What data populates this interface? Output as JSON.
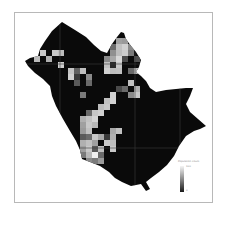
{
  "map": {
    "background": "#ffffff",
    "fill_color": "#0a0a0a",
    "frame_color": "#b8b8b8",
    "grid_line_color": "#3a3a3a",
    "outline": "62,22 75,30 86,37 94,45 101,51 107,53 112,44 117,37 121,32 124,33 126,39 131,46 136,52 141,60 139,67 136,72 141,76 146,81 150,88 156,92 166,90 176,89 186,88 193,88 190,96 186,104 190,112 198,119 206,126 200,129 194,131 186,136 179,146 174,156 167,165 159,172 151,178 146,182 150,189 146,191 141,184 131,186 122,182 115,178 109,172 100,166 90,162 82,159 80,150 76,141 70,131 63,119 56,106 52,96 50,86 43,79 35,73 28,66 25,61 30,58 38,56 40,49 45,41 52,31",
    "grid_lines": {
      "vertical_x": [
        60,
        135,
        180
      ],
      "horizontal_y": [
        64,
        148
      ]
    },
    "cells": [
      {
        "x": 40,
        "y": 50,
        "shade": "#c8c8c8"
      },
      {
        "x": 52,
        "y": 50,
        "shade": "#c8c8c8"
      },
      {
        "x": 58,
        "y": 50,
        "shade": "#bdbdbd"
      },
      {
        "x": 34,
        "y": 56,
        "shade": "#bcbcbc"
      },
      {
        "x": 46,
        "y": 56,
        "shade": "#b0b0b0"
      },
      {
        "x": 58,
        "y": 62,
        "shade": "#cfcfcf"
      },
      {
        "x": 68,
        "y": 68,
        "shade": "#c4c4c4"
      },
      {
        "x": 74,
        "y": 68,
        "shade": "#606060"
      },
      {
        "x": 80,
        "y": 68,
        "shade": "#bebebe"
      },
      {
        "x": 68,
        "y": 74,
        "shade": "#d0d0d0"
      },
      {
        "x": 74,
        "y": 74,
        "shade": "#3a3a3a"
      },
      {
        "x": 86,
        "y": 74,
        "shade": "#8a8a8a"
      },
      {
        "x": 74,
        "y": 80,
        "shade": "#5a5a5a"
      },
      {
        "x": 86,
        "y": 80,
        "shade": "#6a6a6a"
      },
      {
        "x": 80,
        "y": 92,
        "shade": "#7a7a7a"
      },
      {
        "x": 116,
        "y": 38,
        "shade": "#a0a0a0"
      },
      {
        "x": 122,
        "y": 38,
        "shade": "#9a9a9a"
      },
      {
        "x": 110,
        "y": 44,
        "shade": "#6a6a6a"
      },
      {
        "x": 116,
        "y": 44,
        "shade": "#c0c0c0"
      },
      {
        "x": 122,
        "y": 44,
        "shade": "#d0d0d0"
      },
      {
        "x": 128,
        "y": 44,
        "shade": "#8a8a8a"
      },
      {
        "x": 110,
        "y": 50,
        "shade": "#909090"
      },
      {
        "x": 116,
        "y": 50,
        "shade": "#bdbdbd"
      },
      {
        "x": 122,
        "y": 50,
        "shade": "#cccccc"
      },
      {
        "x": 128,
        "y": 50,
        "shade": "#7a7a7a"
      },
      {
        "x": 104,
        "y": 56,
        "shade": "#8a8a8a"
      },
      {
        "x": 110,
        "y": 56,
        "shade": "#a8a8a8"
      },
      {
        "x": 116,
        "y": 56,
        "shade": "#d8d8d8"
      },
      {
        "x": 122,
        "y": 56,
        "shade": "#4a4a4a"
      },
      {
        "x": 134,
        "y": 56,
        "shade": "#505050"
      },
      {
        "x": 104,
        "y": 62,
        "shade": "#c2c2c2"
      },
      {
        "x": 110,
        "y": 62,
        "shade": "#2a2a2a"
      },
      {
        "x": 116,
        "y": 62,
        "shade": "#c8c8c8"
      },
      {
        "x": 128,
        "y": 68,
        "shade": "#6a6a6a"
      },
      {
        "x": 134,
        "y": 68,
        "shade": "#b8b8b8"
      },
      {
        "x": 140,
        "y": 68,
        "shade": "#c8c8c8"
      },
      {
        "x": 104,
        "y": 68,
        "shade": "#d0d0d0"
      },
      {
        "x": 110,
        "y": 68,
        "shade": "#bdbdbd"
      },
      {
        "x": 116,
        "y": 68,
        "shade": "#c0c0c0"
      },
      {
        "x": 128,
        "y": 80,
        "shade": "#c2c2c2"
      },
      {
        "x": 122,
        "y": 86,
        "shade": "#6a6a6a"
      },
      {
        "x": 134,
        "y": 86,
        "shade": "#b0b0b0"
      },
      {
        "x": 116,
        "y": 86,
        "shade": "#4a4a4a"
      },
      {
        "x": 128,
        "y": 92,
        "shade": "#8a8a8a"
      },
      {
        "x": 134,
        "y": 92,
        "shade": "#c8c8c8"
      },
      {
        "x": 110,
        "y": 92,
        "shade": "#d0d0d0"
      },
      {
        "x": 104,
        "y": 98,
        "shade": "#c0c0c0"
      },
      {
        "x": 110,
        "y": 98,
        "shade": "#d2d2d2"
      },
      {
        "x": 104,
        "y": 104,
        "shade": "#c8c8c8"
      },
      {
        "x": 98,
        "y": 104,
        "shade": "#bcbcbc"
      },
      {
        "x": 92,
        "y": 110,
        "shade": "#c6c6c6"
      },
      {
        "x": 98,
        "y": 110,
        "shade": "#d0d0d0"
      },
      {
        "x": 86,
        "y": 110,
        "shade": "#6a6a6a"
      },
      {
        "x": 80,
        "y": 116,
        "shade": "#b0b0b0"
      },
      {
        "x": 92,
        "y": 116,
        "shade": "#d4d4d4"
      },
      {
        "x": 86,
        "y": 116,
        "shade": "#c2c2c2"
      },
      {
        "x": 80,
        "y": 122,
        "shade": "#a0a0a0"
      },
      {
        "x": 86,
        "y": 122,
        "shade": "#c8c8c8"
      },
      {
        "x": 92,
        "y": 122,
        "shade": "#b8b8b8"
      },
      {
        "x": 80,
        "y": 128,
        "shade": "#9a9a9a"
      },
      {
        "x": 86,
        "y": 128,
        "shade": "#c0c0c0"
      },
      {
        "x": 110,
        "y": 128,
        "shade": "#a8a8a8"
      },
      {
        "x": 116,
        "y": 128,
        "shade": "#c0c0c0"
      },
      {
        "x": 80,
        "y": 134,
        "shade": "#5a5a5a"
      },
      {
        "x": 86,
        "y": 134,
        "shade": "#6a6a6a"
      },
      {
        "x": 92,
        "y": 134,
        "shade": "#c8c8c8"
      },
      {
        "x": 98,
        "y": 134,
        "shade": "#a8a8a8"
      },
      {
        "x": 104,
        "y": 134,
        "shade": "#3a3a3a"
      },
      {
        "x": 110,
        "y": 134,
        "shade": "#b0b0b0"
      },
      {
        "x": 80,
        "y": 140,
        "shade": "#b0b0b0"
      },
      {
        "x": 86,
        "y": 140,
        "shade": "#c0c0c0"
      },
      {
        "x": 92,
        "y": 140,
        "shade": "#a0a0a0"
      },
      {
        "x": 104,
        "y": 140,
        "shade": "#c8c8c8"
      },
      {
        "x": 110,
        "y": 140,
        "shade": "#bdbdbd"
      },
      {
        "x": 80,
        "y": 146,
        "shade": "#a0a0a0"
      },
      {
        "x": 86,
        "y": 146,
        "shade": "#c8c8c8"
      },
      {
        "x": 92,
        "y": 146,
        "shade": "#5a5a5a"
      },
      {
        "x": 98,
        "y": 146,
        "shade": "#c0c0c0"
      },
      {
        "x": 110,
        "y": 146,
        "shade": "#c8c8c8"
      },
      {
        "x": 80,
        "y": 152,
        "shade": "#7a7a7a"
      },
      {
        "x": 86,
        "y": 152,
        "shade": "#b8b8b8"
      },
      {
        "x": 92,
        "y": 152,
        "shade": "#f0f0f0"
      },
      {
        "x": 98,
        "y": 152,
        "shade": "#6a6a6a"
      },
      {
        "x": 86,
        "y": 158,
        "shade": "#8a8a8a"
      },
      {
        "x": 92,
        "y": 158,
        "shade": "#7a7a7a"
      },
      {
        "x": 98,
        "y": 158,
        "shade": "#9a9a9a"
      }
    ],
    "cell_size": 6
  },
  "legend": {
    "title": "Population Count",
    "max_label": "100",
    "min_label": "0",
    "gradient": [
      "#f4f4f4",
      "#8a8a8a",
      "#1a1a1a"
    ]
  }
}
